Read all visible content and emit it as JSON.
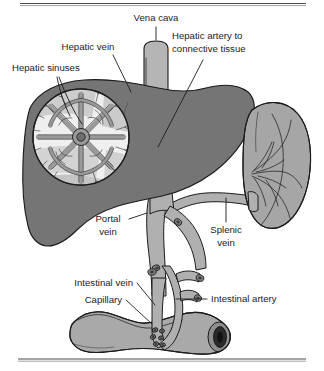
{
  "figure": {
    "kind": "anatomical-diagram",
    "background_color": "#ffffff"
  },
  "labels": {
    "vena_cava": "Vena cava",
    "hepatic_vein": "Hepatic vein",
    "hepatic_sinuses": "Hepatic sinuses",
    "hepatic_artery_line1": "Hepatic artery to",
    "hepatic_artery_line2": "connective tissue",
    "portal_vein_line1": "Portal",
    "portal_vein_line2": "vein",
    "splenic_vein_line1": "Splenic",
    "splenic_vein_line2": "vein",
    "intestinal_vein": "Intestinal vein",
    "capillary": "Capillary",
    "intestinal_artery": "Intestinal artery"
  },
  "colors": {
    "liver_fill": "#757575",
    "spleen_fill": "#a6a6a6",
    "vessel_fill": "#b0b0b0",
    "vena_cava_fill": "#b5b5b5",
    "intestine_fill": "#a9a9a9",
    "lobule_light": "#f0f0f0",
    "lobule_mid": "#bdbdbd",
    "outline": "#1b1b1b",
    "text": "#1b1b1b",
    "rule": "#4a4a4a"
  },
  "structures": {
    "liver": "liver",
    "spleen": "spleen",
    "intestine": "intestine",
    "vena_cava": "vena-cava",
    "portal_vein": "portal-vein",
    "splenic_vein": "splenic-vein",
    "hepatic_sinuses_inset": "hepatic-sinuses-magnified-lobule"
  }
}
